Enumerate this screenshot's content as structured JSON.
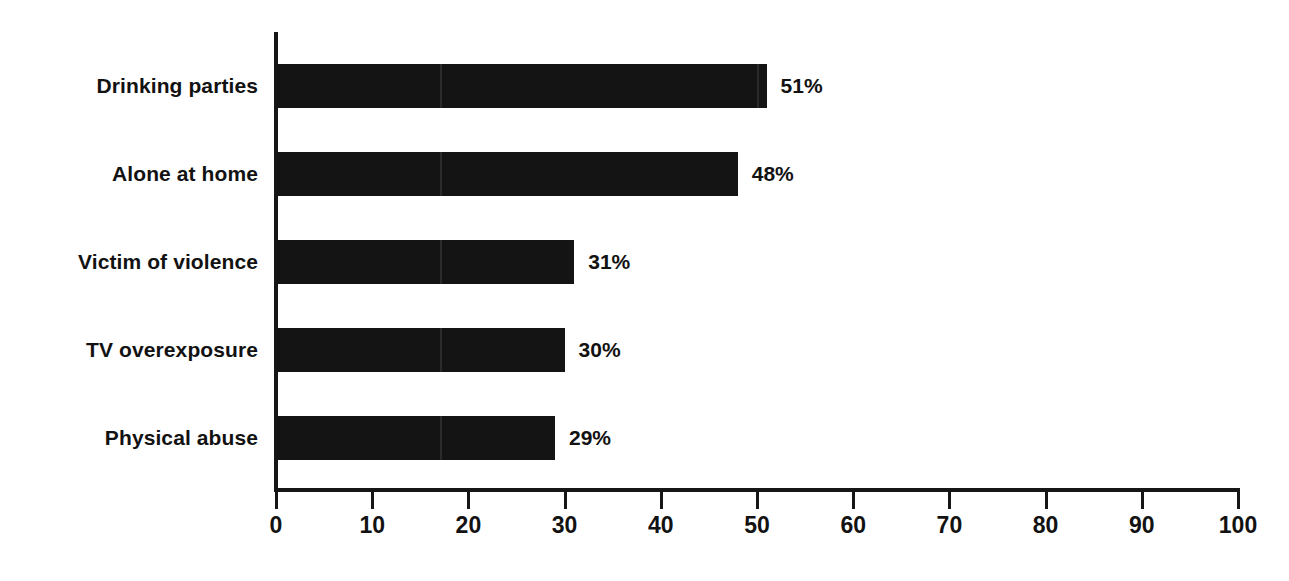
{
  "chart_data": {
    "type": "bar",
    "orientation": "horizontal",
    "title": "",
    "subtitle": "",
    "xlabel": "",
    "ylabel": "",
    "categories": [
      "Drinking parties",
      "Alone at home",
      "Victim of violence",
      "TV overexposure",
      "Physical abuse"
    ],
    "values": [
      51,
      48,
      31,
      30,
      29
    ],
    "value_labels": [
      "51%",
      "48%",
      "31%",
      "30%",
      "29%"
    ],
    "xlim": [
      0,
      100
    ],
    "ylim": null,
    "xticks": [
      0,
      10,
      20,
      30,
      40,
      50,
      60,
      70,
      80,
      90,
      100
    ],
    "xtick_labels": [
      "0",
      "10",
      "20",
      "30",
      "40",
      "50",
      "60",
      "70",
      "80",
      "90",
      "100"
    ],
    "grid": false,
    "legend": null,
    "legend_position": "none",
    "bar_color": "#141414",
    "axis_color": "#161616",
    "text_color": "#121212",
    "background_color": "#ffffff",
    "annotations": []
  },
  "top_crop_text": ""
}
